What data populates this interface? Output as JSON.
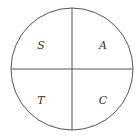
{
  "diagram": {
    "type": "quadrant-circle",
    "title_partial": "",
    "center": [
      72,
      69
    ],
    "radius": 61,
    "stroke_color": "#555555",
    "quadrants": [
      {
        "position": "top-left",
        "label": "S"
      },
      {
        "position": "top-right",
        "label": "A"
      },
      {
        "position": "bottom-left",
        "label": "T"
      },
      {
        "position": "bottom-right",
        "label": "C"
      }
    ]
  }
}
